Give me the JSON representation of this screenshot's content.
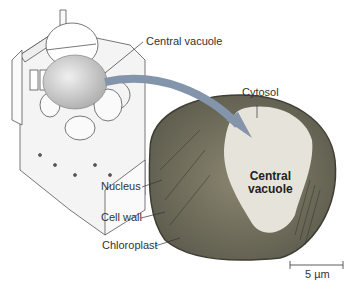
{
  "figure": {
    "labels": {
      "central_vacuole_top": "Central vacuole",
      "cytosol": "Cytosol",
      "central_vacuole_micro_line1": "Central",
      "central_vacuole_micro_line2": "vacuole",
      "nucleus": "Nucleus",
      "cell_wall": "Cell wall",
      "chloroplast": "Chloroplast",
      "scale_bar": "5 µm"
    },
    "colors": {
      "arrow": "#7f8fa8",
      "micrograph_outer": "#6b6a5c",
      "cytoplasm": "#8e8a72",
      "vacuole": "#e8e6dc",
      "drawing_line": "#555555",
      "vacuole_sphere": "#c9c9c9"
    }
  }
}
